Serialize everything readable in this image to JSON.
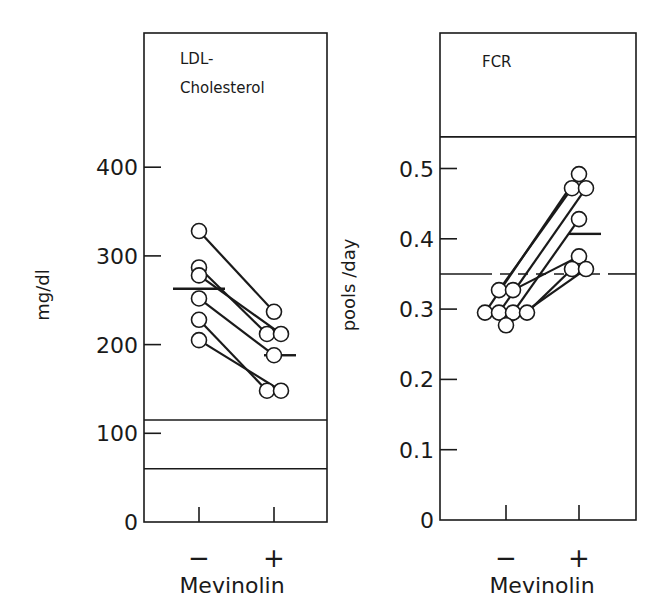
{
  "chart_data": [
    {
      "type": "scatter",
      "subtype": "paired-before-after",
      "title_lines": [
        "LDL-",
        "Cholesterol"
      ],
      "xlabel": "Mevinolin",
      "ylabel": "mg/dl",
      "categories": [
        "−",
        "+"
      ],
      "ylim": [
        0,
        480
      ],
      "yticks": [
        0,
        100,
        200,
        300,
        400
      ],
      "ytick_labels": [
        "0",
        "100",
        "200",
        "300",
        "400"
      ],
      "pairs": [
        {
          "before": 328,
          "after": 237
        },
        {
          "before": 287,
          "after": 212
        },
        {
          "before": 278,
          "after": 212
        },
        {
          "before": 252,
          "after": 188
        },
        {
          "before": 228,
          "after": 148
        },
        {
          "before": 205,
          "after": 148
        }
      ],
      "means": {
        "before": 263,
        "after": 188
      },
      "reference_band": {
        "low": 60,
        "high": 115,
        "style": "solid"
      }
    },
    {
      "type": "scatter",
      "subtype": "paired-before-after",
      "title_lines": [
        "FCR"
      ],
      "xlabel": "Mevinolin",
      "ylabel": "pools /day",
      "categories": [
        "−",
        "+"
      ],
      "ylim": [
        0,
        0.69
      ],
      "yticks": [
        0,
        0.1,
        0.2,
        0.3,
        0.4,
        0.5
      ],
      "ytick_labels": [
        "0",
        "0.1",
        "0.2",
        "0.3",
        "0.4",
        "0.5"
      ],
      "pairs": [
        {
          "before": 0.327,
          "after": 0.472
        },
        {
          "before": 0.327,
          "after": 0.375
        },
        {
          "before": 0.295,
          "after": 0.492
        },
        {
          "before": 0.295,
          "after": 0.472
        },
        {
          "before": 0.295,
          "after": 0.428
        },
        {
          "before": 0.295,
          "after": 0.357
        },
        {
          "before": 0.277,
          "after": 0.357
        }
      ],
      "means": {
        "before": 0.297,
        "after": 0.407
      },
      "reference_band": {
        "low": 0.35,
        "high": 0.545,
        "style": "solid-with-dashed-segment"
      }
    }
  ]
}
